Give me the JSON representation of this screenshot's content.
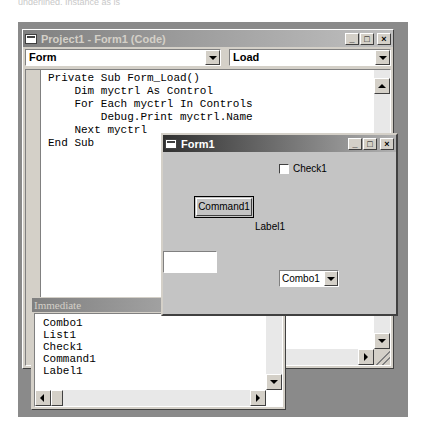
{
  "page": {
    "top_cut_text": "underlined. Instance as is"
  },
  "code_window": {
    "title": "Project1 - Form1 (Code)",
    "object_combo": "Form",
    "procedure_combo": "Load",
    "code_lines": "Private Sub Form_Load()\n    Dim myctrl As Control\n    For Each myctrl In Controls\n        Debug.Print myctrl.Name\n    Next myctrl\nEnd Sub",
    "caption_buttons": {
      "minimize": "_",
      "maximize": "□",
      "close": "×"
    }
  },
  "form_window": {
    "title": "Form1",
    "check_label": "Check1",
    "command_label": "Command1",
    "label_text": "Label1",
    "textbox_value": "",
    "combo_value": "Combo1",
    "caption_buttons": {
      "minimize": "_",
      "maximize": "□",
      "close": "×"
    }
  },
  "immediate_window": {
    "title": "Immediate",
    "output": "Combo1\nList1\nCheck1\nCommand1\nLabel1"
  }
}
